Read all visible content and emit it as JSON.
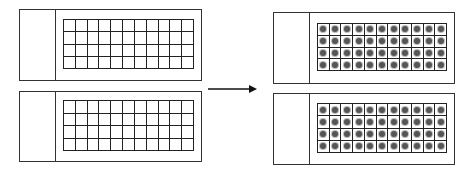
{
  "diagram": {
    "grid": {
      "rows": 4,
      "cols": 11
    },
    "colors": {
      "line": "#222222",
      "dot": "#555555",
      "border": "#333333"
    },
    "slides": [
      {
        "id": "left-top",
        "x": 19,
        "y": 9,
        "w": 183,
        "h": 72,
        "divider": 35,
        "grid_x": 43,
        "grid_y": 9,
        "grid_w": 131,
        "grid_h": 50,
        "filled": false
      },
      {
        "id": "left-bottom",
        "x": 19,
        "y": 91,
        "w": 183,
        "h": 71,
        "divider": 35,
        "grid_x": 43,
        "grid_y": 8,
        "grid_w": 131,
        "grid_h": 51,
        "filled": false
      },
      {
        "id": "right-top",
        "x": 273,
        "y": 12,
        "w": 182,
        "h": 72,
        "divider": 35,
        "grid_x": 43,
        "grid_y": 10,
        "grid_w": 130,
        "grid_h": 48,
        "filled": true
      },
      {
        "id": "right-bottom",
        "x": 273,
        "y": 93,
        "w": 182,
        "h": 72,
        "divider": 35,
        "grid_x": 43,
        "grid_y": 9,
        "grid_w": 130,
        "grid_h": 50,
        "filled": true
      }
    ],
    "arrow": {
      "x1": 208,
      "x2": 257,
      "y": 89,
      "direction": "right"
    }
  }
}
